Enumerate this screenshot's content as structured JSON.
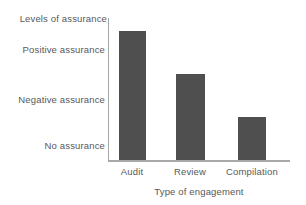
{
  "chart_data": {
    "type": "bar",
    "title": "",
    "xlabel": "Type of engagement",
    "ylabel": "Levels of assurance",
    "categories": [
      "Audit",
      "Review",
      "Compilation"
    ],
    "values": [
      3,
      2,
      1
    ],
    "ytick_labels": [
      "Positive assurance",
      "Negative assurance",
      "No assurance"
    ],
    "ytick_values": [
      3,
      2,
      1
    ],
    "ylim": [
      0,
      3.3
    ],
    "grid": false,
    "legend": false,
    "series": [
      {
        "name": "Level of assurance",
        "values": [
          3,
          2,
          1
        ]
      }
    ],
    "bar_color": "#4f4f4f",
    "axis_color": "#a8a8a8",
    "text_color": "#58585a"
  },
  "axes": {
    "y_title": "Levels of assurance",
    "x_title": "Type of engagement",
    "y_ticks": [
      {
        "label": "Positive assurance"
      },
      {
        "label": "Negative assurance"
      },
      {
        "label": "No assurance"
      }
    ],
    "x_ticks": [
      {
        "label": "Audit"
      },
      {
        "label": "Review"
      },
      {
        "label": "Compilation"
      }
    ]
  }
}
